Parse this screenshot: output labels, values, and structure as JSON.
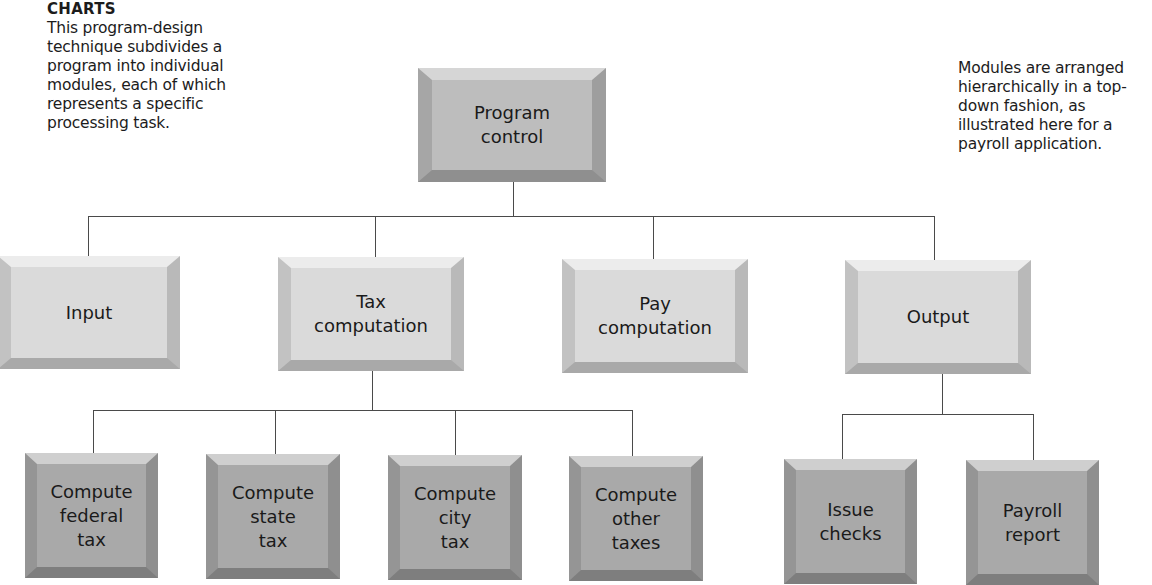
{
  "captions": {
    "left": {
      "heading": "CHARTS",
      "text": "This program-design technique subdivides a program into individual modules, each of which represents a specific processing task."
    },
    "right": {
      "text": "Modules are arranged hierarchically in a top-down fashion, as illustrated here for a payroll application."
    }
  },
  "diagram": {
    "type": "hierarchy-chart",
    "root": {
      "label": "Program\ncontrol"
    },
    "level2": [
      {
        "label": "Input"
      },
      {
        "label": "Tax\ncomputation"
      },
      {
        "label": "Pay\ncomputation"
      },
      {
        "label": "Output"
      }
    ],
    "tax_children": [
      {
        "label": "Compute\nfederal\ntax"
      },
      {
        "label": "Compute\nstate\ntax"
      },
      {
        "label": "Compute\ncity\ntax"
      },
      {
        "label": "Compute\nother\ntaxes"
      }
    ],
    "output_children": [
      {
        "label": "Issue\nchecks"
      },
      {
        "label": "Payroll\nreport"
      }
    ]
  },
  "colors": {
    "root_fill": "#bdbdbd",
    "level2_fill": "#dadada",
    "level3_fill": "#a9a9a9",
    "connector": "#4a4a4a"
  }
}
